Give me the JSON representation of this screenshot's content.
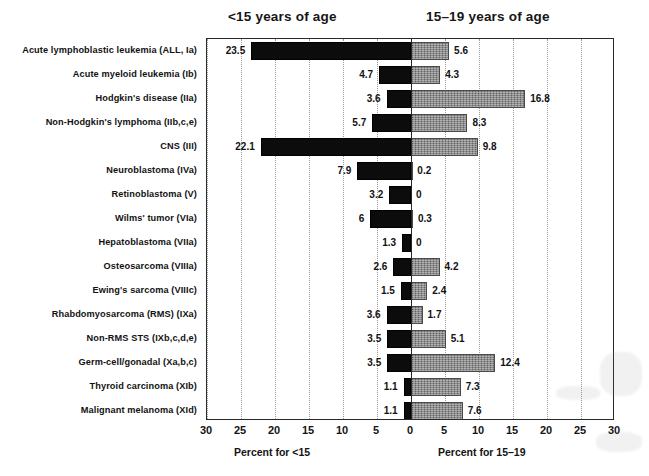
{
  "header": {
    "left_title": "<15 years of age",
    "right_title": "15–19 years of age"
  },
  "axis": {
    "ticks": [
      "30",
      "25",
      "20",
      "15",
      "10",
      "5",
      "0",
      "5",
      "10",
      "15",
      "20",
      "25",
      "30"
    ],
    "left_axis_title": "Percent for <15",
    "right_axis_title": "Percent for 15–19"
  },
  "colors": {
    "bar_left": "#0c0c0c",
    "bar_right": "#7d7d7d",
    "frame": "#2a2a2a",
    "grid": "#9a9a9a",
    "text": "#121212"
  },
  "chart_data": {
    "type": "bar",
    "title": "",
    "subtitle": "",
    "orientation": "horizontal",
    "layout": "diverging-population-pyramid",
    "xlabel": "Percent",
    "ylabel": "",
    "xlim": [
      -30,
      30
    ],
    "xtick_step": 5,
    "grid": true,
    "legend_position": "top",
    "categories": [
      "Acute lymphoblastic leukemia (ALL, Ia)",
      "Acute myeloid leukemia (Ib)",
      "Hodgkin's disease (IIa)",
      "Non-Hodgkin's lymphoma (IIb,c,e)",
      "CNS (III)",
      "Neuroblastoma (IVa)",
      "Retinoblastoma (V)",
      "Wilms' tumor (VIa)",
      "Hepatoblastoma (VIIa)",
      "Osteosarcoma (VIIIa)",
      "Ewing's sarcoma (VIIIc)",
      "Rhabdomyosarcoma (RMS) (IXa)",
      "Non-RMS STS (IXb,c,d,e)",
      "Germ-cell/gonadal (Xa,b,c)",
      "Thyroid carcinoma (XIb)",
      "Malignant melanoma (XId)"
    ],
    "series": [
      {
        "name": "<15 years of age",
        "side": "left",
        "color": "#0c0c0c",
        "values": [
          23.5,
          4.7,
          3.6,
          5.7,
          22.1,
          7.9,
          3.2,
          6,
          1.3,
          2.6,
          1.5,
          3.6,
          3.5,
          3.5,
          1.1,
          1.1
        ],
        "labels": [
          "23.5",
          "4.7",
          "3.6",
          "5.7",
          "22.1",
          "7.9",
          "3.2",
          "6",
          "1.3",
          "2.6",
          "1.5",
          "3.6",
          "3.5",
          "3.5",
          "1.1",
          "1.1"
        ]
      },
      {
        "name": "15–19 years of age",
        "side": "right",
        "color": "#7d7d7d",
        "values": [
          5.6,
          4.3,
          16.8,
          8.3,
          9.8,
          0.2,
          0,
          0.3,
          0,
          4.2,
          2.4,
          1.7,
          5.1,
          12.4,
          7.3,
          7.6
        ],
        "labels": [
          "5.6",
          "4.3",
          "16.8",
          "8.3",
          "9.8",
          "0.2",
          "0",
          "0.3",
          "0",
          "4.2",
          "2.4",
          "1.7",
          "5.1",
          "12.4",
          "7.3",
          "7.6"
        ]
      }
    ]
  }
}
